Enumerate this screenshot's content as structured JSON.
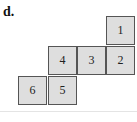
{
  "label": "d.",
  "net": {
    "cells": [
      {
        "id": "1",
        "text": "1",
        "x": 106,
        "y": 16
      },
      {
        "id": "2",
        "text": "2",
        "x": 106,
        "y": 46
      },
      {
        "id": "3",
        "text": "3",
        "x": 77,
        "y": 46
      },
      {
        "id": "4",
        "text": "4",
        "x": 48,
        "y": 46
      },
      {
        "id": "5",
        "text": "5",
        "x": 48,
        "y": 76
      },
      {
        "id": "6",
        "text": "6",
        "x": 18,
        "y": 76
      }
    ],
    "fill_color": "#dedede",
    "border_color": "#555555"
  }
}
